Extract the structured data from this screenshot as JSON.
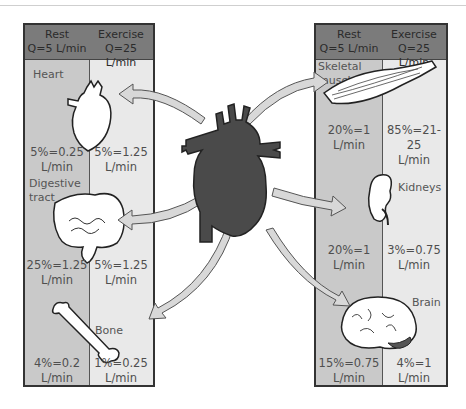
{
  "left_panel": {
    "header": {
      "rest_label": "Rest",
      "rest_q": "Q=5 L/min",
      "exercise_label": "Exercise",
      "exercise_q": "Q=25 L/min"
    },
    "organs": [
      {
        "name": "Heart",
        "rest": "5%=0.25",
        "rest_unit": "L/min",
        "exercise": "5%=1.25",
        "exercise_unit": "L/min"
      },
      {
        "name": "Digestive tract",
        "name_line1": "Digestive",
        "name_line2": "tract",
        "rest": "25%=1.25",
        "rest_unit": "L/min",
        "exercise": "5%=1.25",
        "exercise_unit": "L/min"
      },
      {
        "name": "Bone",
        "rest": "4%=0.2",
        "rest_unit": "L/min",
        "exercise": "1%=0.25",
        "exercise_unit": "L/min"
      }
    ]
  },
  "right_panel": {
    "header": {
      "rest_label": "Rest",
      "rest_q": "Q=5 L/min",
      "exercise_label": "Exercise",
      "exercise_q": "Q=25 L/min"
    },
    "organs": [
      {
        "name": "Skeletal muscle",
        "name_line1": "Skeletal",
        "name_line2": "muscle",
        "rest": "20%=1",
        "rest_unit": "L/min",
        "exercise": "85%=21-25",
        "exercise_unit": "L/min"
      },
      {
        "name": "Kidneys",
        "rest": "20%=1",
        "rest_unit": "L/min",
        "exercise": "3%=0.75",
        "exercise_unit": "L/min"
      },
      {
        "name": "Brain",
        "rest": "15%=0.75",
        "rest_unit": "L/min",
        "exercise": "4%=1",
        "exercise_unit": "L/min"
      }
    ]
  },
  "center": {
    "icon": "heart-icon",
    "arrows_to": [
      "Heart",
      "Digestive tract",
      "Bone",
      "Skeletal muscle",
      "Kidneys",
      "Brain"
    ]
  },
  "colors": {
    "header_bg": "#7b7b7b",
    "rest_col_bg": "#c9c9c9",
    "exercise_col_bg": "#e9e9e9",
    "heart_fill": "#4a4a4a",
    "arrow_fill": "#d8d8d8"
  }
}
